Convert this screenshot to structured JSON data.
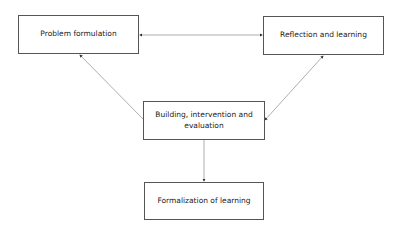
{
  "diagram": {
    "nodes": [
      {
        "id": "problem",
        "label": "Problem formulation"
      },
      {
        "id": "reflection",
        "label": "Reflection and learning"
      },
      {
        "id": "building",
        "label": "Building, intervention and evaluation"
      },
      {
        "id": "formalization",
        "label": "Formalization of learning"
      }
    ],
    "edges": [
      {
        "from": "problem",
        "to": "reflection",
        "direction": "both"
      },
      {
        "from": "building",
        "to": "problem",
        "direction": "forward"
      },
      {
        "from": "building",
        "to": "reflection",
        "direction": "both"
      },
      {
        "from": "building",
        "to": "formalization",
        "direction": "forward"
      }
    ],
    "colors": {
      "line": "#888888",
      "border": "#555555",
      "text": "#222222"
    }
  }
}
